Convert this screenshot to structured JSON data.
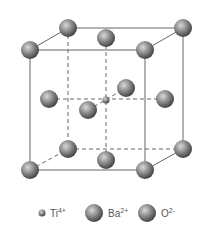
{
  "diagram": {
    "colors": {
      "edge": "#555555",
      "atom_dark": "#3a3a3a",
      "atom_light": "#cfcfcf",
      "background": "#ffffff"
    },
    "atoms": [
      {
        "species": "Ba",
        "x": 68,
        "y": 28,
        "r": 9
      },
      {
        "species": "Ba",
        "x": 183,
        "y": 28,
        "r": 9
      },
      {
        "species": "O",
        "x": 106,
        "y": 38,
        "r": 9
      },
      {
        "species": "Ba",
        "x": 30,
        "y": 50,
        "r": 9
      },
      {
        "species": "Ba",
        "x": 145,
        "y": 50,
        "r": 9
      },
      {
        "species": "O",
        "x": 126,
        "y": 88,
        "r": 9
      },
      {
        "species": "O",
        "x": 49,
        "y": 99,
        "r": 9
      },
      {
        "species": "Ti",
        "x": 106,
        "y": 100,
        "r": 3.5
      },
      {
        "species": "O",
        "x": 165,
        "y": 99,
        "r": 9
      },
      {
        "species": "O",
        "x": 88,
        "y": 110,
        "r": 9
      },
      {
        "species": "Ba",
        "x": 68,
        "y": 149,
        "r": 9
      },
      {
        "species": "Ba",
        "x": 183,
        "y": 149,
        "r": 9
      },
      {
        "species": "O",
        "x": 106,
        "y": 160,
        "r": 9
      },
      {
        "species": "Ba",
        "x": 30,
        "y": 170,
        "r": 9
      },
      {
        "species": "Ba",
        "x": 145,
        "y": 170,
        "r": 9
      }
    ]
  },
  "legend": {
    "items": [
      {
        "symbol": "Ti",
        "charge": "4+"
      },
      {
        "symbol": "Ba",
        "charge": "2+"
      },
      {
        "symbol": "O",
        "charge": "2-"
      }
    ]
  }
}
